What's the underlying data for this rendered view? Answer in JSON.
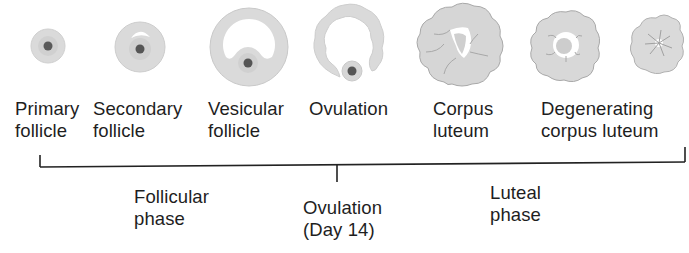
{
  "stages": [
    {
      "id": "primary",
      "line1": "Primary",
      "line2": "follicle",
      "x": 15,
      "y": 98
    },
    {
      "id": "secondary",
      "line1": "Secondary",
      "line2": "follicle",
      "x": 93,
      "y": 98
    },
    {
      "id": "vesicular",
      "line1": "Vesicular",
      "line2": "follicle",
      "x": 208,
      "y": 98
    },
    {
      "id": "ovulation",
      "line1": "Ovulation",
      "line2": "",
      "x": 309,
      "y": 98
    },
    {
      "id": "corpus",
      "line1": "Corpus",
      "line2": "luteum",
      "x": 433,
      "y": 98
    },
    {
      "id": "degenerating",
      "line1": "Degenerating",
      "line2": "corpus luteum",
      "x": 541,
      "y": 98
    }
  ],
  "phases": {
    "follicular": {
      "line1": "Follicular",
      "line2": "phase"
    },
    "ovulation": {
      "line1": "Ovulation",
      "line2": "(Day 14)"
    },
    "luteal": {
      "line1": "Luteal",
      "line2": "phase"
    }
  },
  "colors": {
    "tissue": "#d8d8d8",
    "tissue_edge": "#bdbdbd",
    "nucleus": "#555555",
    "line": "#222222"
  }
}
